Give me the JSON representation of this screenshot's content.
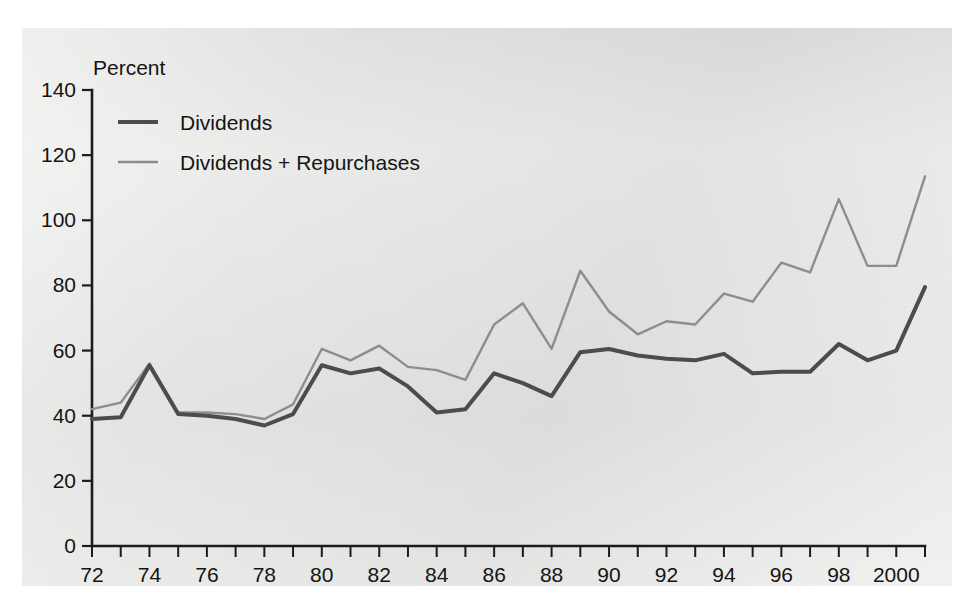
{
  "figure": {
    "y_axis_unit_label": "Percent"
  },
  "legend": {
    "position": "top-left",
    "items": [
      {
        "label": "Dividends",
        "color": "#4c4c4c",
        "swatch": "line-swatch-dark"
      },
      {
        "label": "Dividends + Repurchases",
        "color": "#8d8d8d",
        "swatch": "line-swatch-light"
      }
    ]
  },
  "chart_data": {
    "type": "line",
    "title": "",
    "subtitle": "",
    "xlabel": "",
    "ylabel": "Percent",
    "xlim": [
      1972,
      2001
    ],
    "ylim": [
      0,
      140
    ],
    "ytick_values": [
      0,
      20,
      40,
      60,
      80,
      100,
      120,
      140
    ],
    "ytick_labels": [
      "0",
      "20",
      "40",
      "60",
      "80",
      "100",
      "120",
      "140"
    ],
    "grid": false,
    "legend_position": "top-left",
    "x": [
      1972,
      1973,
      1974,
      1975,
      1976,
      1977,
      1978,
      1979,
      1980,
      1981,
      1982,
      1983,
      1984,
      1985,
      1986,
      1987,
      1988,
      1989,
      1990,
      1991,
      1992,
      1993,
      1994,
      1995,
      1996,
      1997,
      1998,
      1999,
      2000,
      2001
    ],
    "xtick_values": [
      1972,
      1973,
      1974,
      1975,
      1976,
      1977,
      1978,
      1979,
      1980,
      1981,
      1982,
      1983,
      1984,
      1985,
      1986,
      1987,
      1988,
      1989,
      1990,
      1991,
      1992,
      1993,
      1994,
      1995,
      1996,
      1997,
      1998,
      1999,
      2000,
      2001
    ],
    "xtick_labels": [
      "72",
      "",
      "74",
      "",
      "76",
      "",
      "78",
      "",
      "80",
      "",
      "82",
      "",
      "84",
      "",
      "86",
      "",
      "88",
      "",
      "90",
      "",
      "92",
      "",
      "94",
      "",
      "96",
      "",
      "98",
      "",
      "2000",
      ""
    ],
    "series": [
      {
        "name": "Dividends",
        "color": "#4c4c4c",
        "values": [
          39,
          39.5,
          55.5,
          40.5,
          40,
          39,
          37,
          40.5,
          55.5,
          53,
          54.5,
          49,
          41,
          42,
          53,
          50,
          46,
          59.5,
          60.5,
          58.5,
          57.5,
          57,
          59,
          53,
          53.5,
          53.5,
          62,
          57,
          60,
          79.5
        ]
      },
      {
        "name": "Dividends + Repurchases",
        "color": "#8d8d8d",
        "values": [
          42,
          44,
          56,
          41,
          41,
          40.5,
          39,
          43.5,
          60.5,
          57,
          61.5,
          55,
          54,
          51,
          68,
          74.5,
          60.5,
          84.5,
          72,
          65,
          69,
          68,
          77.5,
          75,
          87,
          84,
          106.5,
          86,
          86,
          113.5
        ]
      }
    ]
  }
}
